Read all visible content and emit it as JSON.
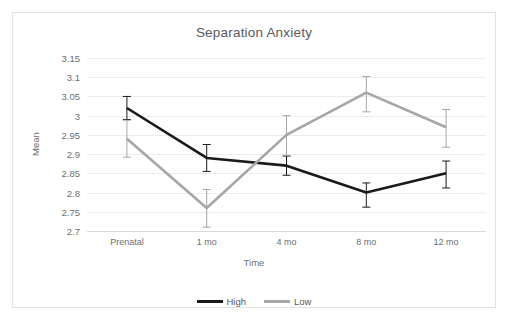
{
  "chart_data": {
    "type": "line",
    "title": "Separation Anxiety",
    "xlabel": "Time",
    "ylabel": "Mean",
    "categories": [
      "Prenatal",
      "1 mo",
      "4 mo",
      "8 mo",
      "12 mo"
    ],
    "ylim": [
      2.7,
      3.15
    ],
    "ytick_step": 0.05,
    "ytick_labels": [
      "3.15",
      "3.1",
      "3.05",
      "3",
      "2.95",
      "2.9",
      "2.85",
      "2.8",
      "2.75",
      "2.7"
    ],
    "ytick_values": [
      3.15,
      3.1,
      3.05,
      3.0,
      2.95,
      2.9,
      2.85,
      2.8,
      2.75,
      2.7
    ],
    "grid": true,
    "legend_position": "bottom",
    "error_bars": true,
    "series": [
      {
        "name": "High",
        "color": "#1a1a1a",
        "values": [
          3.02,
          2.89,
          2.87,
          2.8,
          2.85
        ],
        "error_low": [
          2.99,
          2.855,
          2.845,
          2.762,
          2.812
        ],
        "error_high": [
          3.05,
          2.925,
          2.895,
          2.825,
          2.882
        ]
      },
      {
        "name": "Low",
        "color": "#a6a6a6",
        "values": [
          2.94,
          2.76,
          2.95,
          3.06,
          2.97
        ],
        "error_low": [
          2.892,
          2.71,
          2.897,
          3.01,
          2.918
        ],
        "error_high": [
          2.988,
          2.808,
          3.0,
          3.102,
          3.016
        ]
      }
    ]
  },
  "legend": {
    "entries": [
      {
        "label": "High",
        "color": "#1a1a1a"
      },
      {
        "label": "Low",
        "color": "#a6a6a6"
      }
    ]
  },
  "colors": {
    "high_series": "#1a1a1a",
    "low_series": "#a6a6a6",
    "gridline": "#ececec",
    "text": "#5a5a5a",
    "border": "#e3e3e3"
  }
}
